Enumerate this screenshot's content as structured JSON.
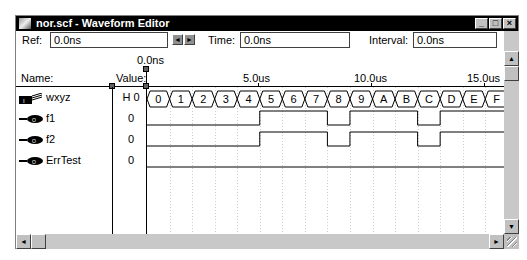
{
  "window": {
    "title": "nor.scf - Waveform Editor",
    "controls": [
      "_",
      "□",
      "×"
    ]
  },
  "toolbar": {
    "ref_label": "Ref:",
    "ref_value": "0.0ns",
    "time_label": "Time:",
    "time_value": "0.0ns",
    "interval_label": "Interval:",
    "interval_value": "0.0ns",
    "prev_arrow": "◄",
    "next_arrow": "►"
  },
  "ruler": {
    "cursor_label": "0.0ns",
    "ticks": [
      {
        "label": "5.0us",
        "us": 5
      },
      {
        "label": "10.0us",
        "us": 10
      },
      {
        "label": "15.0us",
        "us": 15
      }
    ]
  },
  "columns": {
    "name": "Name:",
    "value": "Value:"
  },
  "signals": [
    {
      "name": "wxyz",
      "value": "H 0",
      "type": "bus",
      "icon": "bus-input-icon",
      "bus_values": [
        "0",
        "1",
        "2",
        "3",
        "4",
        "5",
        "6",
        "7",
        "8",
        "9",
        "A",
        "B",
        "C",
        "D",
        "E",
        "F"
      ]
    },
    {
      "name": "f1",
      "value": "0",
      "type": "output",
      "icon": "output-pin-icon",
      "transitions": [
        [
          0,
          0
        ],
        [
          5,
          1
        ],
        [
          8,
          0
        ],
        [
          9,
          1
        ],
        [
          12,
          0
        ],
        [
          13,
          1
        ]
      ]
    },
    {
      "name": "f2",
      "value": "0",
      "type": "output",
      "icon": "output-pin-icon",
      "transitions": [
        [
          0,
          0
        ],
        [
          5,
          1
        ],
        [
          8,
          0
        ],
        [
          9,
          1
        ],
        [
          12,
          0
        ],
        [
          13,
          1
        ]
      ]
    },
    {
      "name": "ErrTest",
      "value": "0",
      "type": "output",
      "icon": "output-pin-icon",
      "transitions": [
        [
          0,
          0
        ]
      ]
    }
  ],
  "scrollbars": {
    "up": "▲",
    "down": "▼",
    "left": "◄",
    "right": "►"
  }
}
